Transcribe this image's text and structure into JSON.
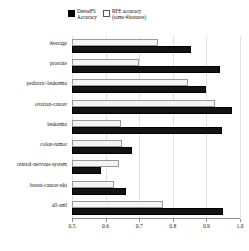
{
  "legend": {
    "entries": [
      {
        "marker": "filled-square-icon",
        "line1": "DenseFS",
        "line2": "Accuracy"
      },
      {
        "marker": "hollow-square-icon",
        "line1": "RFE accuracy",
        "line2": "(same #features)"
      }
    ]
  },
  "axis": {
    "xticks": [
      "0.5",
      "0.6",
      "0.7",
      "0.8",
      "0.9",
      "1.0"
    ]
  },
  "colors": {
    "densefs_bar": "#131313",
    "rfe_bar": "#f4f4f4",
    "rfe_bar_border": "#9a9a9a",
    "gridline": "#e2e2e2",
    "axis": "#8f8f8f",
    "text": "#1a1a1a"
  },
  "chart_data": {
    "type": "bar",
    "orientation": "horizontal",
    "title": "",
    "xlabel": "",
    "ylabel": "",
    "xlim": [
      0.5,
      1.0
    ],
    "grid": true,
    "legend_position": "top",
    "categories": [
      "Average",
      "prostate",
      "pediatric-leukemia",
      "ovarian-cancer",
      "leukemia",
      "colon-tumor",
      "central-nervous-system",
      "breast-cancer-nki",
      "all-aml"
    ],
    "series": [
      {
        "name": "DenseFS Accuracy",
        "color": "#131313",
        "values": [
          0.855,
          0.94,
          0.9,
          0.975,
          0.945,
          0.68,
          0.585,
          0.66,
          0.95
        ]
      },
      {
        "name": "RFE accuracy (same #features)",
        "color": "#f4f4f4",
        "values": [
          0.755,
          0.7,
          0.845,
          0.925,
          0.645,
          0.65,
          0.64,
          0.625,
          0.77
        ]
      }
    ],
    "xticks": [
      0.5,
      0.6,
      0.7,
      0.8,
      0.9,
      1.0
    ]
  }
}
